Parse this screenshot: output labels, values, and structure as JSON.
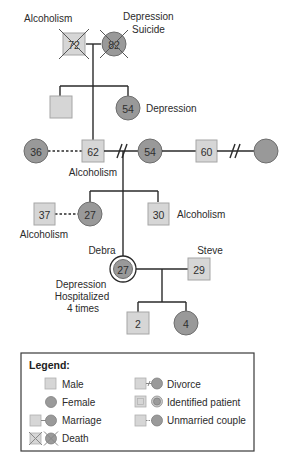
{
  "genogram": {
    "gen1": {
      "grandfather": {
        "age": "72",
        "label": "Alcoholism"
      },
      "grandmother": {
        "age": "82",
        "label_line1": "Depression",
        "label_line2": "Suicide"
      }
    },
    "gen2": {
      "uncle": {
        "age": ""
      },
      "aunt": {
        "age": "54",
        "label": "Depression"
      },
      "father": {
        "age": "62",
        "label": "Alcoholism"
      },
      "father_partner": {
        "age": "36"
      },
      "mother": {
        "age": "54"
      },
      "stepfather": {
        "age": "60"
      },
      "stepfather_ex": {
        "age": ""
      }
    },
    "gen3": {
      "sister": {
        "age": "27"
      },
      "sister_partner": {
        "age": "37",
        "label": "Alcoholism"
      },
      "brother": {
        "age": "30",
        "label": "Alcoholism"
      },
      "debra": {
        "name": "Debra",
        "age": "27",
        "label_line1": "Depression",
        "label_line2": "Hospitalized",
        "label_line3": "4 times"
      },
      "steve": {
        "name": "Steve",
        "age": "29"
      }
    },
    "gen4": {
      "son": {
        "age": "2"
      },
      "daughter": {
        "age": "4"
      }
    }
  },
  "legend": {
    "title": "Legend:",
    "items": [
      {
        "icon": "male-square",
        "label": "Male"
      },
      {
        "icon": "female-circle",
        "label": "Female"
      },
      {
        "icon": "marriage",
        "label": "Marriage"
      },
      {
        "icon": "death",
        "label": "Death"
      },
      {
        "icon": "divorce",
        "label": "Divorce"
      },
      {
        "icon": "identified-patient",
        "label": "Identified patient"
      },
      {
        "icon": "unmarried-couple",
        "label": "Unmarried couple"
      }
    ]
  },
  "colors": {
    "male_fill": "#d6d6d6",
    "female_fill": "#999999",
    "line": "#2a2a2a"
  }
}
